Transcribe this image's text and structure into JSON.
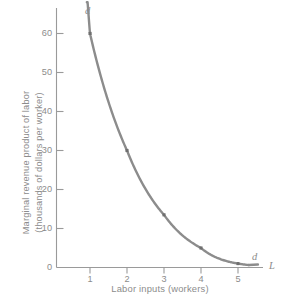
{
  "chart_data": {
    "type": "line",
    "title": "",
    "xlabel": "Labor inputs (workers)",
    "ylabel_line1": "Marginal revenue product of labor",
    "ylabel_line2": "(thousands of dollars per worker)",
    "x_axis_symbol": "L",
    "curve_label_top": "d",
    "curve_label_bottom": "d",
    "series_name": "d",
    "x": [
      1,
      2,
      3,
      4,
      5
    ],
    "values": [
      60,
      30,
      13.5,
      5,
      1
    ],
    "xlim": [
      0.55,
      5.6
    ],
    "ylim": [
      0,
      68
    ],
    "xticks": [
      1,
      2,
      3,
      4,
      5
    ],
    "xtick_labels": [
      "1",
      "2",
      "3",
      "4",
      "5"
    ],
    "yticks": [
      0,
      10,
      20,
      30,
      40,
      50,
      60
    ],
    "ytick_labels": [
      "0",
      "10",
      "20",
      "30",
      "40",
      "50",
      "60"
    ],
    "grid": false,
    "legend": "none",
    "curve_color": "#8c8c8c",
    "axis_color": "#9a9a9a",
    "text_color": "#8c8c8c",
    "background": "#ffffff",
    "markers": [
      {
        "x": 1,
        "y": 60
      },
      {
        "x": 2,
        "y": 30
      },
      {
        "x": 3,
        "y": 13.5
      },
      {
        "x": 4,
        "y": 5
      },
      {
        "x": 5,
        "y": 1
      }
    ]
  }
}
